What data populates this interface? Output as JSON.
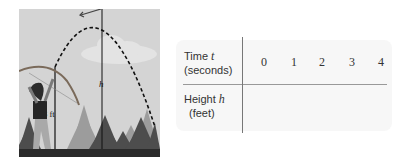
{
  "illustration": {
    "description": "Archer shooting an arrow upward along a dashed parabolic path above a forest",
    "labels": {
      "release_height": "8 ft",
      "max_height": "h"
    },
    "colors": {
      "sky": "#d4d4d4",
      "cloud": "#e6e6e6",
      "ground": "#2a2a2a",
      "trees_far": "#9a9a9a",
      "trees_near": "#4a4a4a",
      "path": "#111111"
    }
  },
  "table": {
    "rows": [
      {
        "label": "Time",
        "variable": "t",
        "unit": "(seconds)",
        "values": [
          "0",
          "1",
          "2",
          "3",
          "4"
        ]
      },
      {
        "label": "Height",
        "variable": "h",
        "unit": "(feet)",
        "values": [
          "",
          "",
          "",
          "",
          ""
        ]
      }
    ]
  }
}
